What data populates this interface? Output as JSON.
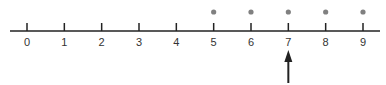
{
  "number_line": {
    "min": 0,
    "max": 9,
    "tick_labels": [
      "0",
      "1",
      "2",
      "3",
      "4",
      "5",
      "6",
      "7",
      "8",
      "9"
    ],
    "dots_at": [
      5,
      6,
      7,
      8,
      9
    ],
    "arrow_at": 7,
    "colors": {
      "axis": "#222222",
      "dot": "#808080",
      "arrow": "#222222",
      "label": "#333333"
    }
  }
}
